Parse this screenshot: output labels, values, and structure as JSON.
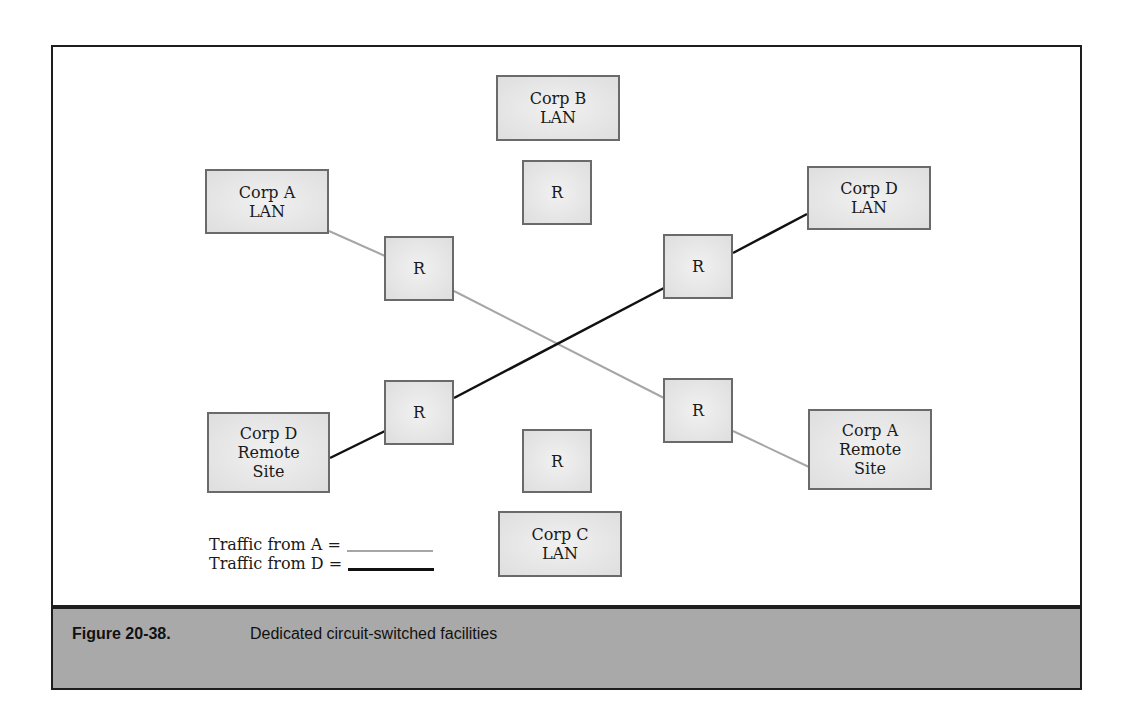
{
  "figure": {
    "number": "Figure 20-38.",
    "caption": "Dedicated circuit-switched facilities"
  },
  "nodes": {
    "corp_b_lan": {
      "line1": "Corp B",
      "line2": "LAN"
    },
    "corp_b_router": {
      "label": "R"
    },
    "corp_a_lan": {
      "line1": "Corp A",
      "line2": "LAN"
    },
    "corp_d_lan": {
      "line1": "Corp D",
      "line2": "LAN"
    },
    "router_a_top": {
      "label": "R"
    },
    "router_d_top": {
      "label": "R"
    },
    "router_d_bottom": {
      "label": "R"
    },
    "router_a_bottom": {
      "label": "R"
    },
    "corp_d_remote": {
      "line1": "Corp D",
      "line2": "Remote",
      "line3": "Site"
    },
    "corp_a_remote": {
      "line1": "Corp A",
      "line2": "Remote",
      "line3": "Site"
    },
    "corp_c_router": {
      "label": "R"
    },
    "corp_c_lan": {
      "line1": "Corp C",
      "line2": "LAN"
    }
  },
  "legend": {
    "traffic_a": "Traffic from A =",
    "traffic_d": "Traffic from D ="
  },
  "colors": {
    "traffic_a": "#a6a6a6",
    "traffic_d": "#111111",
    "caption_bg": "#a9a9a9",
    "node_border": "#6a6a6a"
  }
}
